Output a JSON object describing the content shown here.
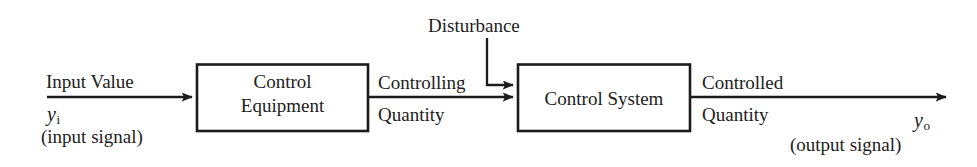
{
  "figure": {
    "type": "block-diagram",
    "background_color": "#ffffff",
    "line_color": "#1c1c1c"
  },
  "blocks": [
    {
      "id": "control-equipment",
      "line1": "Control",
      "line2": "Equipment"
    },
    {
      "id": "control-system",
      "line1": "Control System",
      "line2": ""
    }
  ],
  "signals": {
    "input": {
      "label": "Input Value",
      "variable": "y",
      "subscript": "i",
      "note": "(input signal)"
    },
    "intermediate": {
      "label_top": "Controlling",
      "label_bottom": "Quantity"
    },
    "disturbance": {
      "label": "Disturbance"
    },
    "output": {
      "label_top": "Controlled",
      "label_bottom": "Quantity",
      "variable": "y",
      "subscript": "o",
      "note": "(output signal)"
    }
  }
}
